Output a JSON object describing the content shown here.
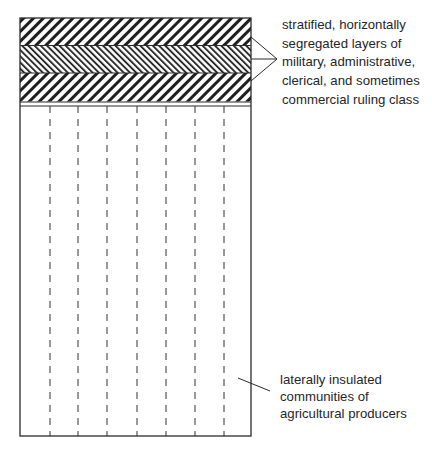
{
  "diagram": {
    "ruling_class": {
      "layers": [
        {
          "name": "upper-layer",
          "pattern": "diagonal-down-coarse"
        },
        {
          "name": "middle-layer",
          "pattern": "diagonal-up-fine"
        },
        {
          "name": "lower-layer",
          "pattern": "diagonal-down-coarse"
        }
      ],
      "label_lines": [
        "stratified, horizontally",
        "segregated layers of",
        "military, administrative,",
        "clerical, and sometimes",
        "commercial ruling class"
      ]
    },
    "producers": {
      "community_count": 8,
      "divider_style": "dashed",
      "label_lines": [
        "laterally insulated",
        "communities of",
        "agricultural producers"
      ]
    },
    "colors": {
      "line": "#2b2b2b",
      "background": "#ffffff",
      "text": "#262626"
    }
  }
}
